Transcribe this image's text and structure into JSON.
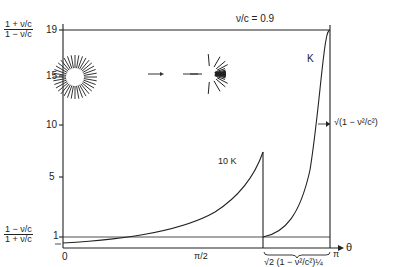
{
  "figure": {
    "title": "ν/c = 0.9",
    "y_axis": {
      "top_label_num": "1 + ν/c",
      "top_label_den": "1 − ν/c",
      "bottom_label_num": "1 − ν/c",
      "bottom_label_den": "1 + ν/c",
      "ticks": [
        "19",
        "15",
        "10",
        "5",
        "1"
      ]
    },
    "x_axis": {
      "label": "θ",
      "ticks": [
        "0",
        "π/2",
        "π"
      ]
    },
    "curve_labels": {
      "k": "K",
      "ten_k": "10 K"
    },
    "annotations": {
      "width_right": "√(1 − ν²/c²)",
      "brace_label": "√2 (1 − ν²/c²)¼"
    },
    "inset": {
      "description": "isotropic starburst transforms to forward-beamed starburst",
      "arrow": "→"
    }
  },
  "chart_data": {
    "type": "line",
    "title": "ν/c = 0.9",
    "xlabel": "θ",
    "ylabel": "(1+ν/c)/(1−ν/c)",
    "xlim": [
      0,
      3.1416
    ],
    "ylim": [
      0,
      19
    ],
    "x_ticks": [
      "0",
      "π/2",
      "π"
    ],
    "y_ticks": [
      1,
      5,
      10,
      15,
      19
    ],
    "series": [
      {
        "name": "10 K",
        "x": [
          0,
          0.8,
          1.57,
          2.0,
          2.3,
          2.53
        ],
        "values": [
          0.53,
          0.9,
          2.2,
          4.5,
          7.2,
          10.0
        ]
      },
      {
        "name": "K",
        "x": [
          2.53,
          2.7,
          2.85,
          2.95,
          3.05,
          3.1416
        ],
        "values": [
          1.0,
          2.5,
          6.0,
          11.0,
          17.0,
          19.0
        ]
      }
    ],
    "reference_lines": [
      {
        "y": 19,
        "label": "(1+ν/c)/(1−ν/c)"
      },
      {
        "y": 1
      },
      {
        "y": 0.053,
        "label": "(1−ν/c)/(1+ν/c)"
      }
    ]
  }
}
